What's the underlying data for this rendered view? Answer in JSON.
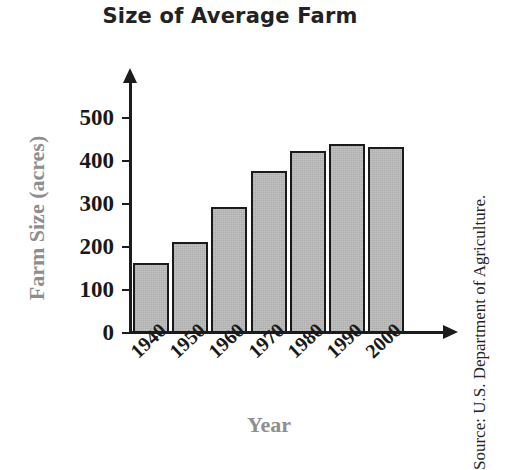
{
  "chart_data": {
    "type": "bar",
    "title": "Size of Average Farm",
    "xlabel": "Year",
    "ylabel": "Farm Size (acres)",
    "categories": [
      "1940",
      "1950",
      "1960",
      "1970",
      "1980",
      "1990",
      "2000"
    ],
    "values": [
      163,
      212,
      293,
      377,
      423,
      440,
      433
    ],
    "ylim": [
      0,
      500
    ],
    "yticks": [
      0,
      100,
      200,
      300,
      400,
      500
    ],
    "ytick_labels": [
      "0",
      "100",
      "200",
      "300",
      "400",
      "500"
    ],
    "grid": false,
    "legend": null,
    "annotations": [
      "Source: U.S. Department of Agriculture."
    ],
    "bar_fill_color": "#bcbcbc",
    "bar_border_color": "#1a1a1a",
    "axis_color": "#1c1c1c",
    "axis_label_color": "#8e8e8e",
    "tick_label_color": "#191919",
    "title_color": "#222222",
    "background_color": "#ffffff"
  },
  "source": {
    "text": "Source: U.S. Department of Agriculture."
  }
}
